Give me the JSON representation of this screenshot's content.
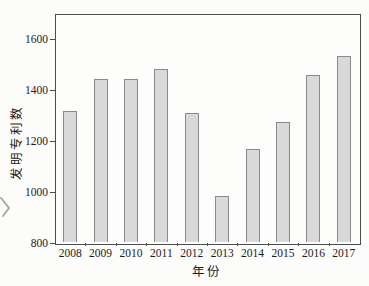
{
  "figure": {
    "background": "#fcfcfa",
    "frame_color": "#4d4d4d",
    "bar_fill": "#d9d9d9",
    "bar_border": "#8a8a8a",
    "text_color": "#1b1b1b"
  },
  "chart_data": {
    "type": "bar",
    "title": "",
    "xlabel": "年份",
    "ylabel": "发明专利数",
    "categories": [
      "2008",
      "2009",
      "2010",
      "2011",
      "2012",
      "2013",
      "2014",
      "2015",
      "2016",
      "2017"
    ],
    "values": [
      1320,
      1445,
      1445,
      1485,
      1310,
      985,
      1170,
      1275,
      1460,
      1535
    ],
    "ylim": [
      800,
      1700
    ],
    "yticks": [
      800,
      1000,
      1200,
      1400,
      1600
    ],
    "grid": false,
    "legend": null,
    "frame": "full-box",
    "bar_style": "light-gray fill, gray outline"
  }
}
